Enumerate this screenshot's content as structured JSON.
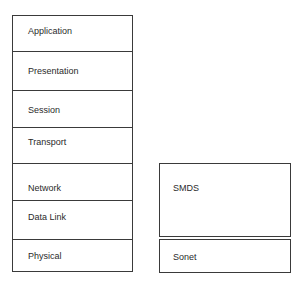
{
  "diagram": {
    "osi_stack": {
      "layers": [
        {
          "label": "Application"
        },
        {
          "label": "Presentation"
        },
        {
          "label": "Session"
        },
        {
          "label": "Transport"
        },
        {
          "label": "Network"
        },
        {
          "label": "Data Link"
        },
        {
          "label": "Physical"
        }
      ]
    },
    "mapping": {
      "smds": {
        "label": "SMDS"
      },
      "sonet": {
        "label": "Sonet"
      }
    }
  }
}
